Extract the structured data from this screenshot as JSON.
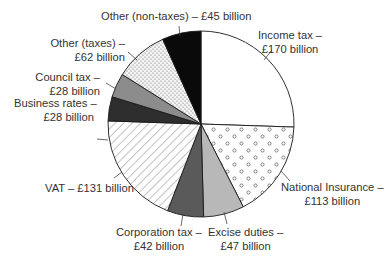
{
  "chart_data": {
    "type": "pie",
    "title": "",
    "unit": "£ billion",
    "start_angle_deg": 0,
    "direction": "clockwise",
    "categories": [
      "Income tax",
      "National Insurance",
      "Excise duties",
      "Corporation tax",
      "VAT",
      "Business rates",
      "Council tax",
      "Other (taxes)",
      "Other (non-taxes)"
    ],
    "values": [
      170,
      113,
      47,
      42,
      131,
      28,
      28,
      62,
      45
    ],
    "fills": [
      "white",
      "circles",
      "light-grey",
      "dark-grey",
      "diagonal-hatch",
      "very-dark-grey",
      "mid-grey",
      "dots",
      "black"
    ],
    "legend": "none (direct labels)"
  },
  "labels": {
    "income_tax": {
      "line1": "Income tax –",
      "line2": "£170 billion"
    },
    "national_insurance": {
      "line1": "National Insurance –",
      "line2": "£113 billion"
    },
    "excise": {
      "line1": "Excise duties –",
      "line2": "£47 billion"
    },
    "corporation": {
      "line1": "Corporation tax –",
      "line2": "£42 billion"
    },
    "vat": {
      "line1": "VAT – £131 billion"
    },
    "business_rates": {
      "line1": "Business rates –",
      "line2": "£28 billion"
    },
    "council_tax": {
      "line1": "Council tax –",
      "line2": "£28 billion"
    },
    "other_taxes": {
      "line1": "Other (taxes) –",
      "line2": "£62  billion"
    },
    "other_non_taxes": {
      "line1": "Other (non-taxes) – £45  billion"
    }
  },
  "colors": {
    "outline": "#1a1a1a",
    "light_grey": "#b8b8b8",
    "mid_grey": "#8c8c8c",
    "dark_grey": "#5a5a5a",
    "very_dark": "#2e2e2e",
    "black": "#0a0a0a"
  }
}
